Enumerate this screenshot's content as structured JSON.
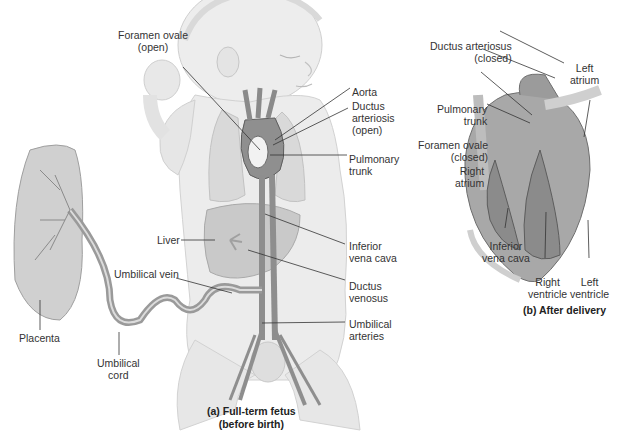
{
  "figure": {
    "panel_a": {
      "caption": "(a) Full-term fetus\n(before birth)",
      "labels": {
        "foramen_ovale": "Foramen ovale\n(open)",
        "aorta": "Aorta",
        "ductus_arteriosis": "Ductus\narteriosis\n(open)",
        "pulmonary_trunk": "Pulmonary\ntrunk",
        "liver": "Liver",
        "inferior_vena_cava": "Inferior\nvena cava",
        "umbilical_vein": "Umbilical vein",
        "ductus_venosus": "Ductus\nvenosus",
        "umbilical_arteries": "Umbilical\narteries",
        "placenta": "Placenta",
        "umbilical_cord": "Umbilical\ncord"
      }
    },
    "panel_b": {
      "caption": "(b) After delivery",
      "labels": {
        "ductus_arteriosus": "Ductus arteriosus\n(closed)",
        "left_atrium": "Left\natrium",
        "pulmonary_trunk": "Pulmonary\ntrunk",
        "foramen_ovale": "Foramen ovale\n(closed)",
        "right_atrium": "Right\natrium",
        "inferior_vena_cava": "Inferior\nvena cava",
        "right_ventricle": "Right\nventricle",
        "left_ventricle": "Left\nventricle"
      }
    },
    "colors": {
      "skin": "#ececec",
      "skin_shade": "#d6d6d6",
      "organ": "#bdbdbd",
      "vessel": "#8e8e8e",
      "vessel_dark": "#6a6a6a",
      "leader_line": "#333333"
    }
  }
}
